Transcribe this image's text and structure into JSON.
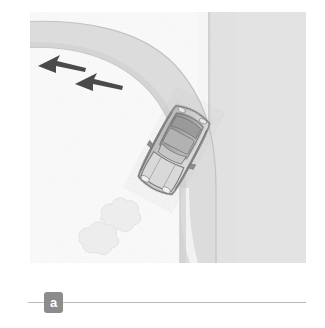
{
  "figure": {
    "caption_label": "a",
    "alt_title": "Car negotiating a curved road approaching a T-junction, with two direction arrows and roadside shrubs"
  },
  "colors": {
    "page_background": "#ffffff",
    "panel_background": "#fbfbfb",
    "ground_light": "#f6f6f6",
    "road_fill": "#dcdcdc",
    "road_edge_line": "#c4c4c4",
    "building_block": "#e2e2e2",
    "building_edge": "#cfcfcf",
    "arrow_dark": "#4a4a4a",
    "car_body": "#c9c9c9",
    "car_body_light": "#dcdcdc",
    "car_roof": "#9e9e9e",
    "car_outline": "#6b6b6b",
    "car_glass": "#b4b4b4",
    "bush_fill": "#ededed",
    "bush_outline": "#e0e0e0",
    "badge_background": "#8c8c8c",
    "badge_text": "#ffffff",
    "rule_line": "#b9b9b9"
  },
  "scene": {
    "road": {
      "name": "curved-two-lane-road",
      "description": "Road curves from upper-left horizontally, bends around a right-hand bend and runs vertically to the bottom of the frame",
      "edge_line_count": 2
    },
    "arrows": [
      {
        "name": "direction-arrow-outer",
        "label": "",
        "heading_degrees": 205,
        "position": {
          "x": 56,
          "y": 74
        }
      },
      {
        "name": "direction-arrow-inner",
        "label": "",
        "heading_degrees": 205,
        "position": {
          "x": 93,
          "y": 92
        }
      }
    ],
    "vehicle": {
      "name": "car-top-view",
      "label": "",
      "rotation_degrees": 28,
      "position": {
        "x": 144,
        "y": 138
      },
      "length_px": 82,
      "width_px": 40
    },
    "shrubs": [
      {
        "name": "shrub-upper",
        "position": {
          "x": 88,
          "y": 209
        },
        "radius_px": 20
      },
      {
        "name": "shrub-lower",
        "position": {
          "x": 68,
          "y": 231
        },
        "radius_px": 19
      }
    ],
    "building": {
      "name": "building-block",
      "label": "",
      "position": {
        "x": 208,
        "y": 12
      },
      "width_px": 98,
      "height_px": 251
    }
  }
}
